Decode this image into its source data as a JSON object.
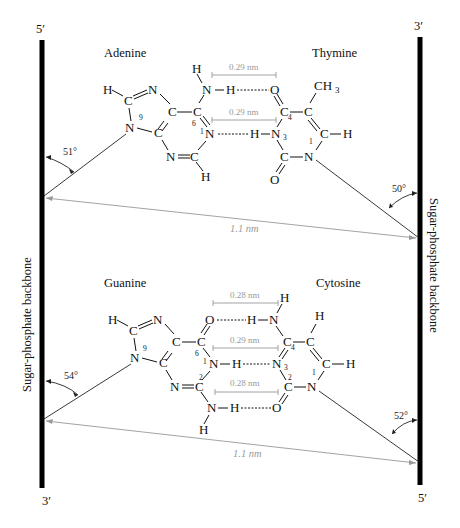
{
  "strands": {
    "left_top_end": "5′",
    "left_bottom_end": "3′",
    "right_top_end": "3′",
    "right_bottom_end": "5′",
    "left_label": "Sugar-phosphate backbone",
    "right_label": "Sugar-phosphate backbone"
  },
  "pair_at": {
    "left_base": "Adenine",
    "right_base": "Thymine",
    "hbond_distances": [
      "0.29 nm",
      "0.29 nm"
    ],
    "angle_left": "51°",
    "angle_right": "50°",
    "c1_distance": "1.1 nm",
    "methyl": "CH",
    "methyl_sub": "3"
  },
  "pair_gc": {
    "left_base": "Guanine",
    "right_base": "Cytosine",
    "hbond_distances": [
      "0.28 nm",
      "0.29 nm",
      "0.28 nm"
    ],
    "angle_left": "54°",
    "angle_right": "52°",
    "c1_distance": "1.1 nm"
  },
  "atoms": {
    "H": "H",
    "C": "C",
    "N": "N",
    "O": "O",
    "idx1": "1",
    "idx2": "2",
    "idx3": "3",
    "idx4": "4",
    "idx6": "6",
    "idx9": "9"
  },
  "colors": {
    "backbone": "#000000",
    "annotation": "#999999",
    "text": "#111111"
  }
}
